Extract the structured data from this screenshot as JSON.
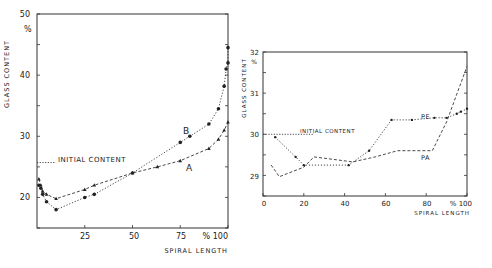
{
  "chart_data": [
    {
      "type": "line",
      "title": "",
      "xlabel": "SPIRAL LENGTH",
      "ylabel": "GLASS CONTENT",
      "y_unit": "%",
      "x_unit": "%",
      "xlim": [
        0,
        100
      ],
      "ylim": [
        15,
        50
      ],
      "x_ticks": [
        25,
        50,
        75,
        100
      ],
      "x_tick_labels": [
        "25",
        "50",
        "75",
        "% 100"
      ],
      "y_ticks": [
        20,
        30,
        40,
        50
      ],
      "y_tick_labels": [
        "20",
        "30",
        "40",
        "50"
      ],
      "grid": false,
      "annotations": [
        {
          "text": "INITIAL CONTENT",
          "y": 25.7,
          "x_range": [
            0,
            10
          ]
        }
      ],
      "series": [
        {
          "name": "B",
          "marker": "circle",
          "line": "dotted",
          "x": [
            1,
            2,
            3,
            5,
            10,
            25,
            30,
            50,
            75,
            80,
            90,
            95,
            98,
            99,
            100,
            100
          ],
          "y": [
            22,
            21.5,
            20.5,
            19.3,
            18,
            20,
            20.5,
            24,
            29,
            30,
            32,
            34.5,
            38.2,
            41,
            42,
            44.5
          ]
        },
        {
          "name": "A",
          "marker": "triangle",
          "line": "dashed",
          "x": [
            1,
            2,
            3,
            5,
            10,
            25,
            30,
            50,
            63,
            75,
            90,
            95,
            98,
            100
          ],
          "y": [
            23,
            22,
            21,
            20.5,
            19.8,
            21.3,
            22,
            24,
            25,
            26,
            28,
            29.5,
            31,
            32.3
          ]
        }
      ]
    },
    {
      "type": "line",
      "title": "",
      "xlabel": "SPIRAL LENGTH",
      "ylabel": "GLASS CONTENT",
      "y_unit": "%",
      "x_unit": "%",
      "xlim": [
        0,
        100
      ],
      "ylim": [
        28.5,
        32
      ],
      "x_ticks": [
        0,
        20,
        40,
        60,
        80,
        100
      ],
      "x_tick_labels": [
        "0",
        "20",
        "40",
        "60",
        "80",
        "% 100"
      ],
      "y_ticks": [
        29,
        30,
        31,
        32
      ],
      "y_tick_labels": [
        "29",
        "30",
        "31",
        "32"
      ],
      "grid": false,
      "annotations": [
        {
          "text": "INITIAL CONTENT",
          "y": 30,
          "x_range": [
            0,
            25
          ]
        }
      ],
      "series": [
        {
          "name": "PE",
          "marker": "dot",
          "line": "dotted",
          "x": [
            6,
            16,
            20,
            42,
            52,
            63,
            73,
            84,
            90,
            95,
            97,
            100
          ],
          "y": [
            29.93,
            29.45,
            29.25,
            29.25,
            29.6,
            30.35,
            30.35,
            30.4,
            30.4,
            30.5,
            30.55,
            30.62
          ]
        },
        {
          "name": "PA",
          "marker": "none",
          "line": "dashed",
          "x": [
            4,
            8,
            20,
            25,
            44,
            55,
            66,
            83,
            90,
            100
          ],
          "y": [
            29.25,
            28.97,
            29.2,
            29.45,
            29.33,
            29.45,
            29.6,
            29.6,
            30.3,
            31.65
          ]
        }
      ]
    }
  ],
  "labels": {
    "left": {
      "ylabel": "GLASS CONTENT",
      "yunit": "%",
      "xlabel": "SPIRAL LENGTH",
      "initial": "INITIAL CONTENT",
      "seriesB": "B",
      "seriesA": "A",
      "yt50": "50",
      "yt40": "40",
      "yt30": "30",
      "yt20": "20",
      "xt25": "25",
      "xt50": "50",
      "xt75": "75",
      "xt100": "% 100"
    },
    "right": {
      "ylabel": "GLASS CONTENT",
      "yunit": "%",
      "xlabel": "SPIRAL LENGTH",
      "initial": "INITIAL CONTENT",
      "seriesPE": "PE",
      "seriesPA": "PA",
      "yt32": "32",
      "yt31": "31",
      "yt30": "30",
      "yt29": "29",
      "xt0": "0",
      "xt20": "20",
      "xt40": "40",
      "xt60": "60",
      "xt80": "80",
      "xt100": "% 100"
    }
  }
}
